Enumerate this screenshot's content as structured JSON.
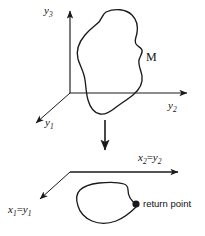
{
  "figure": {
    "title": "",
    "background_color": "#ffffff",
    "stroke_color": "#1a1a1a",
    "width": 205,
    "height": 236
  },
  "upper_diagram": {
    "name": "three-dimensional-state-space",
    "axes": [
      {
        "id": "y3",
        "label": "y",
        "sub": "3",
        "direction": "up",
        "orientation": "vertical"
      },
      {
        "id": "y2",
        "label": "y",
        "sub": "2",
        "direction": "right",
        "orientation": "horizontal"
      },
      {
        "id": "y1",
        "label": "y",
        "sub": "1",
        "direction": "down-left",
        "orientation": "diagonal"
      }
    ],
    "region_label": "M"
  },
  "transition": {
    "name": "projection-arrow",
    "direction": "down"
  },
  "lower_diagram": {
    "name": "poincare-section-plane",
    "axes": [
      {
        "id": "x2",
        "label_main": "x",
        "sub_main": "2",
        "equals": "=",
        "label_eq": "y",
        "sub_eq": "2",
        "direction": "right"
      },
      {
        "id": "x1",
        "label_main": "x",
        "sub_main": "1",
        "equals": "=",
        "label_eq": "y",
        "sub_eq": "1",
        "direction": "down-left"
      }
    ],
    "marker": {
      "label": "return point",
      "shape": "filled-dot"
    }
  }
}
